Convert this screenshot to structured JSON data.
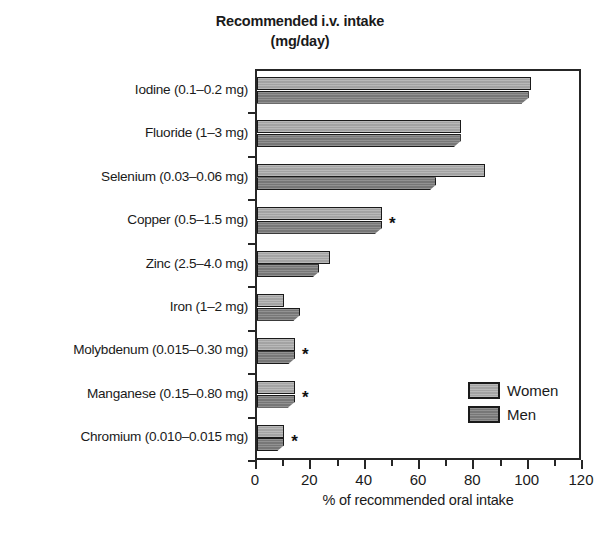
{
  "chart_data": {
    "type": "bar",
    "orientation": "horizontal",
    "title": "Recommended i.v. intake",
    "subtitle": "(mg/day)",
    "xlabel": "% of recommended oral intake",
    "ylabel": "",
    "xlim": [
      0,
      120
    ],
    "xticks": [
      0,
      20,
      40,
      60,
      80,
      100,
      120
    ],
    "xtick_labels": [
      "0",
      "20",
      "40",
      "60",
      "80",
      "100",
      "120"
    ],
    "minor_xticks": [
      10,
      30,
      50,
      70,
      90,
      110
    ],
    "grid": false,
    "legend_position": "lower right",
    "categories": [
      "Iodine (0.1–0.2 mg)",
      "Fluoride (1–3 mg)",
      "Selenium (0.03–0.06 mg)",
      "Copper (0.5–1.5 mg)",
      "Zinc (2.5–4.0 mg)",
      "Iron (1–2 mg)",
      "Molybdenum (0.015–0.30 mg)",
      "Manganese (0.15–0.80 mg)",
      "Chromium (0.010–0.015 mg)"
    ],
    "series": [
      {
        "name": "Women",
        "color": "#acacac",
        "values": [
          101,
          75,
          84,
          46,
          27,
          10,
          14,
          14,
          10
        ]
      },
      {
        "name": "Men",
        "color": "#7d7d7d",
        "values": [
          100,
          75,
          66,
          46,
          23,
          16,
          14,
          14,
          10
        ]
      }
    ],
    "annotations": [
      {
        "category": "Copper (0.5–1.5 mg)",
        "marker": "*"
      },
      {
        "category": "Molybdenum (0.015–0.30 mg)",
        "marker": "*"
      },
      {
        "category": "Manganese (0.15–0.80 mg)",
        "marker": "*"
      },
      {
        "category": "Chromium (0.010–0.015 mg)",
        "marker": "*"
      }
    ]
  },
  "legend": {
    "entries": [
      {
        "label": "Women",
        "color": "#acacac"
      },
      {
        "label": "Men",
        "color": "#7d7d7d"
      }
    ]
  },
  "colors": {
    "women": "#acacac",
    "men": "#7d7d7d",
    "axis": "#262626",
    "text": "#1a1a1a",
    "background": "#ffffff"
  }
}
